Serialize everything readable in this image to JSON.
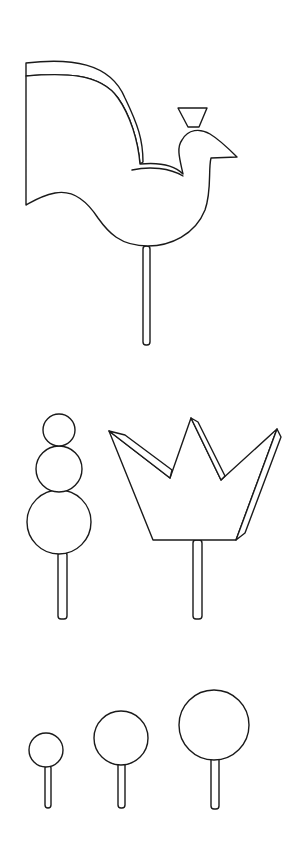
{
  "figure": {
    "colors": {
      "background": "#ffffff",
      "stroke": "#1a1a1a"
    },
    "items": [
      {
        "name": "bird-on-stick"
      },
      {
        "name": "stacked-circles-on-stick",
        "circles": 3
      },
      {
        "name": "crown-on-stick"
      },
      {
        "name": "small-circle-on-stick"
      },
      {
        "name": "medium-circle-on-stick"
      },
      {
        "name": "large-circle-on-stick"
      }
    ]
  }
}
